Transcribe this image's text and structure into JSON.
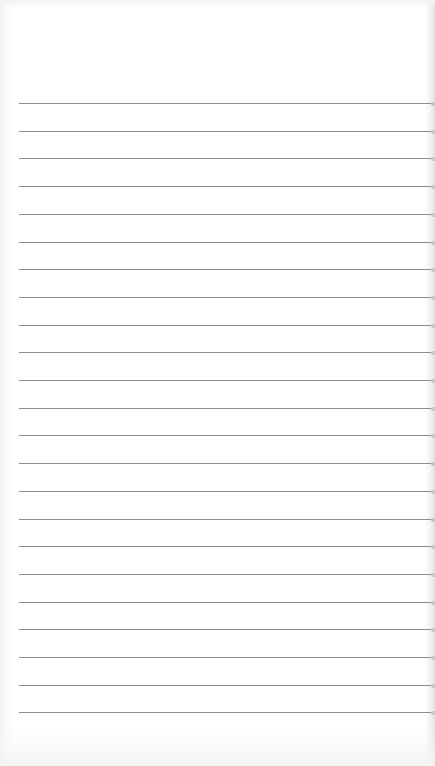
{
  "page": {
    "type": "lined-paper",
    "background_color": "#ffffff",
    "line_color": "#8f8f8f",
    "line_count": 23,
    "first_line_y": 103,
    "line_spacing": 27.7,
    "line_left": 19,
    "line_right": 432
  }
}
